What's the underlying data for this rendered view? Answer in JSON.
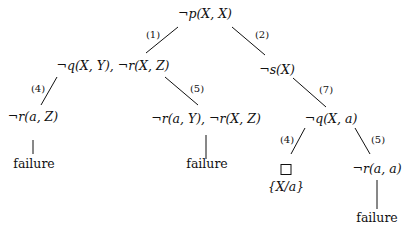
{
  "diagram": {
    "type": "SLD derivation tree",
    "nodes": {
      "root": "¬p(X, X)",
      "n1": "¬q(X, Y), ¬r(X, Z)",
      "n2": "¬s(X)",
      "n1_left": "¬r(a, Z)",
      "n1_right": "¬r(a, Y), ¬r(X, Z)",
      "n2_child": "¬q(X, a)",
      "n2_child_left_subst": "{X/a}",
      "n2_child_right": "¬r(a, a)",
      "fail_1": "failure",
      "fail_2": "failure",
      "fail_3": "failure"
    },
    "edge_labels": {
      "root_n1": "(1)",
      "root_n2": "(2)",
      "n1_left": "(4)",
      "n1_right": "(5)",
      "n2_child": "(7)",
      "q_left": "(4)",
      "q_right": "(5)"
    },
    "empty_clause_symbol": "□"
  }
}
